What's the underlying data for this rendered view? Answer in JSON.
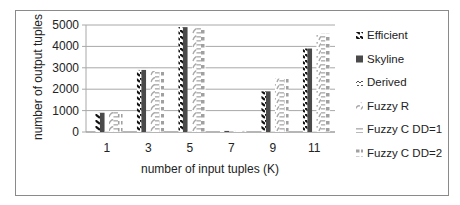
{
  "chart_data": {
    "type": "bar",
    "title": "",
    "xlabel": "number of input tuples (K)",
    "ylabel": "number of output tuples",
    "categories": [
      "1",
      "3",
      "5",
      "7",
      "9",
      "11"
    ],
    "ylim": [
      0,
      5000
    ],
    "yticks": [
      0,
      1000,
      2000,
      3000,
      4000,
      5000
    ],
    "grid": true,
    "legend_position": "right",
    "series": [
      {
        "name": "Efficient",
        "values": [
          900,
          2900,
          4900,
          50,
          1900,
          3900
        ],
        "color": "#1a1a1a",
        "pattern": "diagonal-hatch"
      },
      {
        "name": "Skyline",
        "values": [
          900,
          2900,
          4900,
          50,
          1900,
          3900
        ],
        "color": "#4a4a4a",
        "pattern": "solid"
      },
      {
        "name": "Derived",
        "values": [
          30,
          30,
          30,
          10,
          30,
          30
        ],
        "color": "#666666",
        "pattern": "chevron"
      },
      {
        "name": "Fuzzy R",
        "values": [
          950,
          2850,
          4900,
          50,
          2500,
          4600
        ],
        "color": "#b5b5b5",
        "pattern": "diagonal-light"
      },
      {
        "name": "Fuzzy C DD=1",
        "values": [
          950,
          2850,
          4900,
          50,
          2500,
          4600
        ],
        "color": "#c0c0c0",
        "pattern": "horizontal"
      },
      {
        "name": "Fuzzy C DD=2",
        "values": [
          950,
          2850,
          4900,
          50,
          2500,
          4600
        ],
        "color": "#a8a8a8",
        "pattern": "dots"
      }
    ]
  }
}
